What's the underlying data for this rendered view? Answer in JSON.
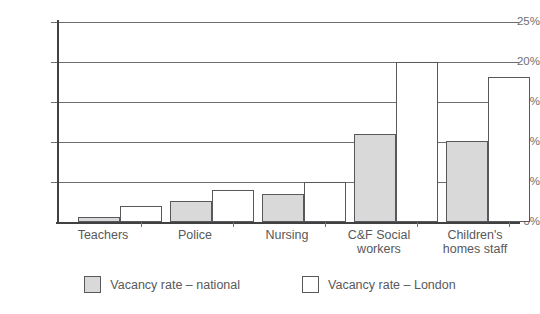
{
  "chart_data": {
    "type": "bar",
    "title": "",
    "xlabel": "",
    "ylabel": "",
    "ylim": [
      0,
      25
    ],
    "ytick_labels": [
      "0%",
      "5%",
      "10%",
      "15%",
      "20%",
      "25%"
    ],
    "ytick_values": [
      0,
      5,
      10,
      15,
      20,
      25
    ],
    "grid": true,
    "legend_position": "bottom",
    "categories": [
      "Teachers",
      "Police",
      "Nursing",
      "C&F Social workers",
      "Children's homes staff"
    ],
    "series": [
      {
        "name": "Vacancy rate – national",
        "color": "#d9d9d9",
        "values": [
          0.6,
          2.6,
          3.5,
          11.0,
          10.1
        ]
      },
      {
        "name": "Vacancy rate – London",
        "color": "#ffffff",
        "values": [
          2.0,
          4.0,
          5.0,
          20.0,
          18.1
        ]
      }
    ]
  },
  "axis": {
    "y_ticks": [
      {
        "label": "25%",
        "value": 25
      },
      {
        "label": "20%",
        "value": 20
      },
      {
        "label": "15%",
        "value": 15
      },
      {
        "label": "10%",
        "value": 10
      },
      {
        "label": "5%",
        "value": 5
      },
      {
        "label": "0%",
        "value": 0
      }
    ]
  },
  "categories": [
    {
      "label_line1": "Teachers",
      "label_line2": ""
    },
    {
      "label_line1": "Police",
      "label_line2": ""
    },
    {
      "label_line1": "Nursing",
      "label_line2": ""
    },
    {
      "label_line1": "C&F Social",
      "label_line2": "workers"
    },
    {
      "label_line1": "Children's",
      "label_line2": "homes staff"
    }
  ],
  "legend": {
    "items": [
      {
        "label": "Vacancy rate – national",
        "swatch": "national"
      },
      {
        "label": "Vacancy rate – London",
        "swatch": "london"
      }
    ]
  },
  "colors": {
    "national_fill": "#d9d9d9",
    "london_fill": "#ffffff",
    "bar_stroke": "#58595b",
    "gridline": "#6d6e71",
    "axis": "#414042",
    "text": "#58595b"
  }
}
